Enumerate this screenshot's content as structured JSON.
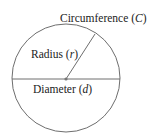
{
  "diagram": {
    "labels": {
      "circumference": {
        "text": "Circumference (",
        "var": "C",
        "close": ")"
      },
      "radius": {
        "text": "Radius (",
        "var": "r",
        "close": ")"
      },
      "diameter": {
        "text": "Diameter (",
        "var": "d",
        "close": ")"
      }
    },
    "colors": {
      "stroke": "#6e6e6e",
      "text": "#222222",
      "center_dot": "#777777"
    }
  }
}
